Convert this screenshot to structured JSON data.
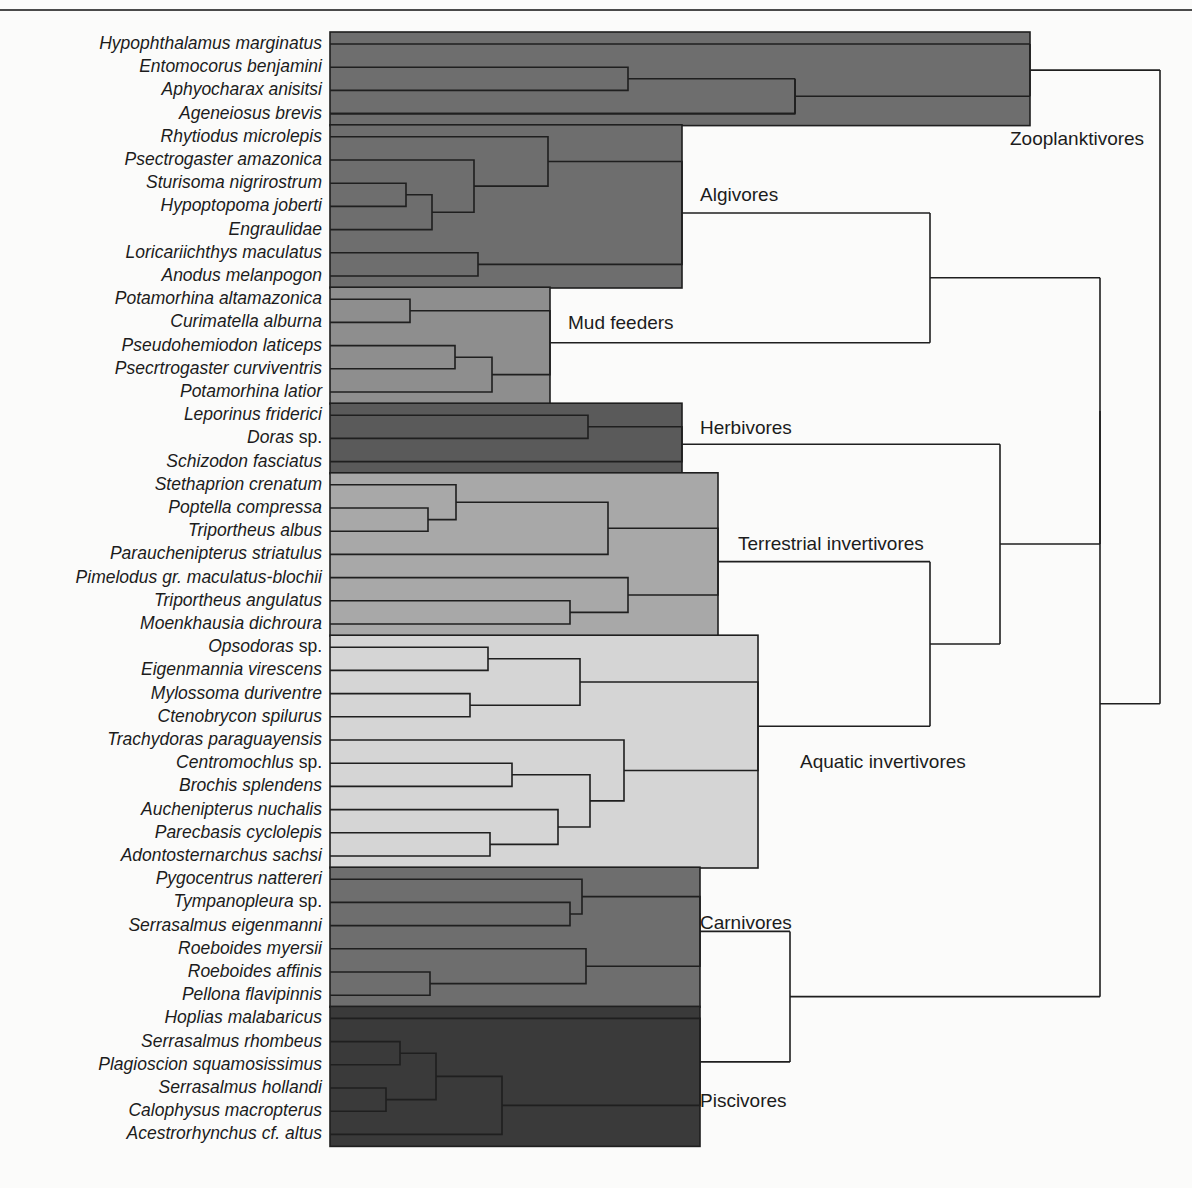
{
  "figure": {
    "type": "dendrogram",
    "orientation": "horizontal-left-to-right",
    "title": "",
    "top_rule": true,
    "background_color": "#fbfbfa",
    "line_color": "#1f1f1f"
  },
  "taxa": [
    {
      "index": 0,
      "label": "Hypophthalamus marginatus",
      "suffix": "",
      "guild": "Zooplanktivores"
    },
    {
      "index": 1,
      "label": "Entomocorus benjamini",
      "suffix": "",
      "guild": "Zooplanktivores"
    },
    {
      "index": 2,
      "label": "Aphyocharax anisitsi",
      "suffix": "",
      "guild": "Zooplanktivores"
    },
    {
      "index": 3,
      "label": "Ageneiosus brevis",
      "suffix": "",
      "guild": "Zooplanktivores"
    },
    {
      "index": 4,
      "label": "Rhytiodus microlepis",
      "suffix": "",
      "guild": "Algivores"
    },
    {
      "index": 5,
      "label": "Psectrogaster amazonica",
      "suffix": "",
      "guild": "Algivores"
    },
    {
      "index": 6,
      "label": "Sturisoma nigrirostrum",
      "suffix": "",
      "guild": "Algivores"
    },
    {
      "index": 7,
      "label": "Hypoptopoma joberti",
      "suffix": "",
      "guild": "Algivores"
    },
    {
      "index": 8,
      "label": "Engraulidae",
      "suffix": "",
      "guild": "Algivores",
      "upright": true
    },
    {
      "index": 9,
      "label": "Loricariichthys maculatus",
      "suffix": "",
      "guild": "Algivores"
    },
    {
      "index": 10,
      "label": "Anodus melanpogon",
      "suffix": "",
      "guild": "Algivores"
    },
    {
      "index": 11,
      "label": "Potamorhina altamazonica",
      "suffix": "",
      "guild": "Mud feeders"
    },
    {
      "index": 12,
      "label": "Curimatella alburna",
      "suffix": "",
      "guild": "Mud feeders"
    },
    {
      "index": 13,
      "label": "Pseudohemiodon laticeps",
      "suffix": "",
      "guild": "Mud feeders"
    },
    {
      "index": 14,
      "label": "Psecrtrogaster curviventris",
      "suffix": "",
      "guild": "Mud feeders"
    },
    {
      "index": 15,
      "label": "Potamorhina latior",
      "suffix": "",
      "guild": "Mud feeders"
    },
    {
      "index": 16,
      "label": "Leporinus friderici",
      "suffix": "",
      "guild": "Herbivores"
    },
    {
      "index": 17,
      "label": "Doras",
      "suffix": " sp.",
      "guild": "Herbivores"
    },
    {
      "index": 18,
      "label": "Schizodon fasciatus",
      "suffix": "",
      "guild": "Herbivores"
    },
    {
      "index": 19,
      "label": "Stethaprion crenatum",
      "suffix": "",
      "guild": "Terrestrial invertivores"
    },
    {
      "index": 20,
      "label": "Poptella compressa",
      "suffix": "",
      "guild": "Terrestrial invertivores"
    },
    {
      "index": 21,
      "label": "Triportheus albus",
      "suffix": "",
      "guild": "Terrestrial invertivores"
    },
    {
      "index": 22,
      "label": "Parauchenipterus striatulus",
      "suffix": "",
      "guild": "Terrestrial invertivores"
    },
    {
      "index": 23,
      "label": "Pimelodus gr. maculatus-blochii",
      "suffix": "",
      "guild": "Terrestrial invertivores"
    },
    {
      "index": 24,
      "label": "Triportheus angulatus",
      "suffix": "",
      "guild": "Terrestrial invertivores"
    },
    {
      "index": 25,
      "label": "Moenkhausia dichroura",
      "suffix": "",
      "guild": "Terrestrial invertivores"
    },
    {
      "index": 26,
      "label": "Opsodoras",
      "suffix": " sp.",
      "guild": "Aquatic invertivores"
    },
    {
      "index": 27,
      "label": "Eigenmannia virescens",
      "suffix": "",
      "guild": "Aquatic invertivores"
    },
    {
      "index": 28,
      "label": "Mylossoma duriventre",
      "suffix": "",
      "guild": "Aquatic invertivores"
    },
    {
      "index": 29,
      "label": "Ctenobrycon spilurus",
      "suffix": "",
      "guild": "Aquatic invertivores"
    },
    {
      "index": 30,
      "label": "Trachydoras paraguayensis",
      "suffix": "",
      "guild": "Aquatic invertivores"
    },
    {
      "index": 31,
      "label": "Centromochlus",
      "suffix": " sp.",
      "guild": "Aquatic invertivores"
    },
    {
      "index": 32,
      "label": "Brochis splendens",
      "suffix": "",
      "guild": "Aquatic invertivores"
    },
    {
      "index": 33,
      "label": "Auchenipterus nuchalis",
      "suffix": "",
      "guild": "Aquatic invertivores"
    },
    {
      "index": 34,
      "label": "Parecbasis cyclolepis",
      "suffix": "",
      "guild": "Aquatic invertivores"
    },
    {
      "index": 35,
      "label": "Adontosternarchus sachsi",
      "suffix": "",
      "guild": "Aquatic invertivores"
    },
    {
      "index": 36,
      "label": "Pygocentrus nattereri",
      "suffix": "",
      "guild": "Carnivores"
    },
    {
      "index": 37,
      "label": "Tympanopleura",
      "suffix": " sp.",
      "guild": "Carnivores"
    },
    {
      "index": 38,
      "label": "Serrasalmus eigenmanni",
      "suffix": "",
      "guild": "Carnivores"
    },
    {
      "index": 39,
      "label": "Roeboides myersii",
      "suffix": "",
      "guild": "Carnivores"
    },
    {
      "index": 40,
      "label": "Roeboides affinis",
      "suffix": "",
      "guild": "Carnivores"
    },
    {
      "index": 41,
      "label": "Pellona flavipinnis",
      "suffix": "",
      "guild": "Carnivores"
    },
    {
      "index": 42,
      "label": "Hoplias malabaricus",
      "suffix": "",
      "guild": "Piscivores"
    },
    {
      "index": 43,
      "label": "Serrasalmus rhombeus",
      "suffix": "",
      "guild": "Piscivores"
    },
    {
      "index": 44,
      "label": "Plagioscion squamosissimus",
      "suffix": "",
      "guild": "Piscivores"
    },
    {
      "index": 45,
      "label": "Serrasalmus hollandi",
      "suffix": "",
      "guild": "Piscivores"
    },
    {
      "index": 46,
      "label": "Calophysus macropterus",
      "suffix": "",
      "guild": "Piscivores"
    },
    {
      "index": 47,
      "label": "Acestrorhynchus cf. altus",
      "suffix": "",
      "guild": "Piscivores"
    }
  ],
  "guilds": [
    {
      "name": "Zooplanktivores",
      "label": "Zooplanktivores",
      "color": "#6e6e6e",
      "first": 0,
      "last": 3,
      "label_x": 1010,
      "label_y": 140
    },
    {
      "name": "Algivores",
      "label": "Algivores",
      "color": "#6e6e6e",
      "first": 4,
      "last": 10,
      "label_x": 700,
      "label_y": 196
    },
    {
      "name": "Mud feeders",
      "label": "Mud feeders",
      "color": "#8e8e8e",
      "first": 11,
      "last": 15,
      "label_x": 568,
      "label_y": 324
    },
    {
      "name": "Herbivores",
      "label": "Herbivores",
      "color": "#5a5a5a",
      "first": 16,
      "last": 18,
      "label_x": 700,
      "label_y": 429
    },
    {
      "name": "Terrestrial invertivores",
      "label": "Terrestrial invertivores",
      "color": "#a8a8a8",
      "first": 19,
      "last": 25,
      "label_x": 738,
      "label_y": 545
    },
    {
      "name": "Aquatic invertivores",
      "label": "Aquatic invertivores",
      "color": "#d5d5d5",
      "first": 26,
      "last": 35,
      "label_x": 800,
      "label_y": 763
    },
    {
      "name": "Carnivores",
      "label": "Carnivores",
      "color": "#6e6e6e",
      "first": 36,
      "last": 41,
      "label_x": 700,
      "label_y": 924
    },
    {
      "name": "Piscivores",
      "label": "Piscivores",
      "color": "#3a3a3a",
      "first": 42,
      "last": 47,
      "label_x": 700,
      "label_y": 1102
    }
  ],
  "chart_data": {
    "type": "dendrogram",
    "n_leaves": 48,
    "guild_count": 8
  }
}
